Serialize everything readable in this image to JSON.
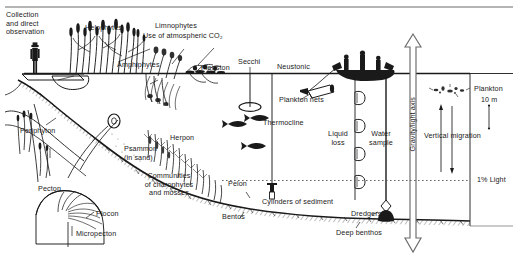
{
  "figure": {
    "background_color": "#ffffff",
    "ink_color": "#1a1a1a",
    "width_px": 518,
    "height_px": 265
  },
  "labels": {
    "collection": "Collection\nand direct\nobservation",
    "helophytes": "Helophytes",
    "limnophytes": "Limnophytes",
    "limnophytes_sub": "Use of atmospheric CO₂",
    "amphiphytes": "Amphiphytes",
    "pleuston": "Pleuston",
    "secchi": "Secchi",
    "neustonic": "Neustonic",
    "plankton_nets": "Plankton nets",
    "thermocline": "Thermocline",
    "liquid_loss": "Liquid\nloss",
    "water_sample": "Water\nsample",
    "gravity_light_axis": "Gravity/light axis",
    "plankton": "Plankton",
    "scale_10m": "10 m",
    "vertical_migration": "Vertical migration",
    "one_percent_light": "1% Light",
    "periphyton": "Periphyton",
    "pecton": "Pecton",
    "plocon": "Plocon",
    "micropecton": "Micropecton",
    "psammon": "Psammon\n(in sand)",
    "herpon": "Herpon",
    "charophytes": "Communities\nof charophytes\nand mosses",
    "pelon": "Pelon",
    "bentos": "Bentos",
    "cylinders": "Cylinders of sediment",
    "dredgers": "Dredgers",
    "deep_benthos": "Deep benthos"
  },
  "icons": {
    "observer": "person-with-hat-icon",
    "boat": "boat-with-researchers-icon",
    "secchi_disk": "secchi-disk-icon",
    "plankton_net": "plankton-net-icon",
    "water_bottle": "water-sample-bottle-icon",
    "sediment_corer": "sediment-cylinder-icon",
    "dredger": "dredger-icon",
    "fish": "fish-icon",
    "plankton_organisms": "plankton-organisms-icon",
    "reeds": "emergent-reeds-icon",
    "submerged_plants": "submerged-macrophytes-icon",
    "gravity_arrow": "double-headed-vertical-arrow-icon",
    "migration_arrows": "vertical-migration-arrows-icon"
  },
  "lines": {
    "top_rule": "horizontal-frame-rule",
    "water_surface": "water-surface-line",
    "light_depth_dotted": "1-percent-light-dotted-line"
  }
}
